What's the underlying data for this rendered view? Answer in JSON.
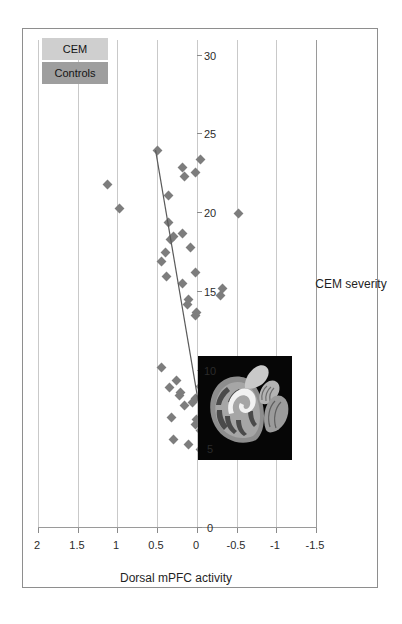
{
  "figure": {
    "rotation_note": "chart rendered landscape, page shows it rotated 90 degrees counter-clockwise"
  },
  "legend": {
    "position": "top-right",
    "items": [
      {
        "label": "Controls",
        "color": "#9e9e9e"
      },
      {
        "label": "CEM",
        "color": "#cfcfcf"
      }
    ]
  },
  "inset": {
    "name": "brain-mri-sagittal",
    "description": "Sagittal brain MRI slice with highlighted medial prefrontal region"
  },
  "chart_data": {
    "type": "scatter",
    "title": "",
    "xlabel": "CEM severity",
    "ylabel": "Dorsal mPFC activity",
    "xlim": [
      0,
      31
    ],
    "ylim": [
      -1.5,
      2
    ],
    "xticks": [
      0,
      5,
      10,
      15,
      20,
      25,
      30
    ],
    "xtick_labels": [
      "0",
      "5",
      "10",
      "15",
      "20",
      "25",
      "30"
    ],
    "yticks": [
      2,
      1.5,
      1,
      0.5,
      0,
      -0.5,
      -1,
      -1.5
    ],
    "ytick_labels": [
      "2",
      "1.5",
      "1",
      "0.5",
      "0",
      "-0.5",
      "-1",
      "-1.5"
    ],
    "grid": {
      "horizontal": true,
      "vertical": false
    },
    "marker": {
      "shape": "diamond",
      "color": "#7d7d7d",
      "size": 7
    },
    "trendline": {
      "type": "linear",
      "color": "#5a5a5a",
      "x_start": 5.0,
      "y_start": -0.12,
      "x_end": 24.0,
      "y_end": 0.52
    },
    "series": [
      {
        "name": "CEM",
        "points": [
          [
            5.0,
            -0.05
          ],
          [
            5.0,
            -0.5
          ],
          [
            5.0,
            -0.62
          ],
          [
            5.0,
            -1.1
          ],
          [
            5.3,
            0.1
          ],
          [
            5.6,
            0.3
          ],
          [
            6.2,
            -0.04
          ],
          [
            6.6,
            0.02
          ],
          [
            6.9,
            0.0
          ],
          [
            7.0,
            0.32
          ],
          [
            7.2,
            -0.07
          ],
          [
            7.4,
            -0.48
          ],
          [
            7.6,
            -0.7
          ],
          [
            7.8,
            0.15
          ],
          [
            8.0,
            0.05
          ],
          [
            8.2,
            0.02
          ],
          [
            8.4,
            0.22
          ],
          [
            8.6,
            0.2
          ],
          [
            8.9,
            0.34
          ],
          [
            9.0,
            -0.05
          ],
          [
            9.4,
            0.26
          ],
          [
            10.0,
            -0.1
          ],
          [
            10.2,
            0.45
          ],
          [
            13.5,
            0.02
          ],
          [
            13.7,
            0.0
          ],
          [
            14.2,
            0.12
          ],
          [
            14.5,
            0.1
          ],
          [
            14.8,
            -0.3
          ],
          [
            15.2,
            -0.32
          ],
          [
            15.5,
            0.18
          ],
          [
            16.0,
            0.38
          ],
          [
            16.2,
            0.02
          ],
          [
            16.9,
            0.44
          ],
          [
            17.5,
            0.4
          ],
          [
            17.8,
            0.08
          ],
          [
            18.3,
            0.33
          ],
          [
            18.5,
            0.3
          ],
          [
            18.7,
            0.18
          ],
          [
            19.4,
            0.36
          ],
          [
            20.0,
            -0.52
          ],
          [
            20.3,
            0.97
          ],
          [
            21.1,
            0.36
          ],
          [
            21.8,
            1.12
          ],
          [
            22.3,
            0.15
          ],
          [
            22.6,
            0.02
          ],
          [
            22.9,
            0.18
          ],
          [
            23.4,
            -0.05
          ],
          [
            24.0,
            0.5
          ]
        ]
      }
    ]
  }
}
